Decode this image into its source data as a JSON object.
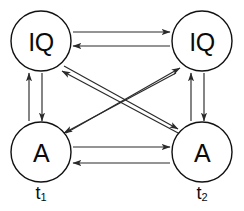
{
  "figure": {
    "type": "cross-lagged-panel-diagram",
    "background_color": "#ffffff",
    "line_color": "#2a2a2a",
    "node_stroke_color": "#111111",
    "text_color": "#0a0a0a"
  },
  "nodes": [
    {
      "id": "iq-t1",
      "label": "IQ",
      "cx": 41,
      "cy": 41,
      "r": 30
    },
    {
      "id": "iq-t2",
      "label": "IQ",
      "cx": 202,
      "cy": 41,
      "r": 30
    },
    {
      "id": "a-t1",
      "label": "A",
      "cx": 41,
      "cy": 152,
      "r": 30
    },
    {
      "id": "a-t2",
      "label": "A",
      "cx": 202,
      "cy": 152,
      "r": 30
    }
  ],
  "time_labels": [
    {
      "id": "t1",
      "base": "t",
      "sub": "1",
      "x": 41,
      "y": 193
    },
    {
      "id": "t2",
      "base": "t",
      "sub": "2",
      "x": 202,
      "y": 193
    }
  ],
  "edges": [
    {
      "id": "iq1-to-iq2",
      "from": "iq-t1",
      "to": "iq-t2",
      "kind": "stability-top",
      "x1": 73,
      "y1": 32,
      "x2": 170,
      "y2": 32
    },
    {
      "id": "iq2-to-iq1",
      "from": "iq-t2",
      "to": "iq-t1",
      "kind": "stability-top",
      "x1": 170,
      "y1": 46,
      "x2": 73,
      "y2": 46
    },
    {
      "id": "a1-to-a2",
      "from": "a-t1",
      "to": "a-t2",
      "kind": "stability-bottom",
      "x1": 73,
      "y1": 147,
      "x2": 170,
      "y2": 147
    },
    {
      "id": "a2-to-a1",
      "from": "a-t2",
      "to": "a-t1",
      "kind": "stability-bottom",
      "x1": 170,
      "y1": 163,
      "x2": 73,
      "y2": 163
    },
    {
      "id": "a1-to-iq1",
      "from": "a-t1",
      "to": "iq-t1",
      "kind": "synchronous-left",
      "x1": 29,
      "y1": 121,
      "x2": 29,
      "y2": 73
    },
    {
      "id": "iq1-to-a1",
      "from": "iq-t1",
      "to": "a-t1",
      "kind": "synchronous-left",
      "x1": 42,
      "y1": 73,
      "x2": 42,
      "y2": 121
    },
    {
      "id": "a2-to-iq2",
      "from": "a-t2",
      "to": "iq-t2",
      "kind": "synchronous-right",
      "x1": 191,
      "y1": 121,
      "x2": 191,
      "y2": 73
    },
    {
      "id": "iq2-to-a2",
      "from": "iq-t2",
      "to": "a-t2",
      "kind": "synchronous-right",
      "x1": 204,
      "y1": 73,
      "x2": 204,
      "y2": 121
    },
    {
      "id": "iq1-to-a2",
      "from": "iq-t1",
      "to": "a-t2",
      "kind": "cross-lagged",
      "x1": 64,
      "y1": 66,
      "x2": 178,
      "y2": 129
    },
    {
      "id": "a2-to-iq1",
      "from": "a-t2",
      "to": "iq-t1",
      "kind": "cross-lagged",
      "x1": 180,
      "y1": 134,
      "x2": 62,
      "y2": 71
    },
    {
      "id": "a1-to-iq2",
      "from": "a-t1",
      "to": "iq-t2",
      "kind": "cross-lagged",
      "x1": 66,
      "y1": 133,
      "x2": 180,
      "y2": 68
    },
    {
      "id": "iq2-to-a1",
      "from": "iq-t2",
      "to": "a-t1",
      "kind": "cross-lagged",
      "x1": 176,
      "y1": 73,
      "x2": 64,
      "y2": 133
    }
  ]
}
